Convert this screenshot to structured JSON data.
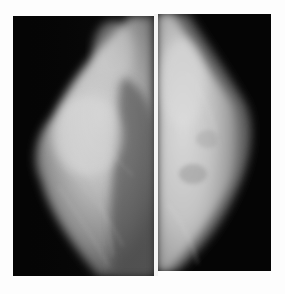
{
  "figure": {
    "type": "mammogram-pair",
    "background_color": "#ffffff",
    "panel_background_color": "#050505",
    "divider_color": "#f4f4f4",
    "tissue_colors": {
      "dense_highlight": "#e8e8e8",
      "mid_tone": "#a9a9a9",
      "shadow": "#5a5a5a"
    },
    "panels": [
      {
        "id": "left",
        "position": "left",
        "box": {
          "x": 13,
          "y": 16,
          "width": 141,
          "height": 260
        }
      },
      {
        "id": "right",
        "position": "right",
        "box": {
          "x": 158,
          "y": 14,
          "width": 113,
          "height": 257
        }
      }
    ],
    "divider": {
      "x": 154,
      "y": 14,
      "width": 4,
      "height": 262
    }
  }
}
